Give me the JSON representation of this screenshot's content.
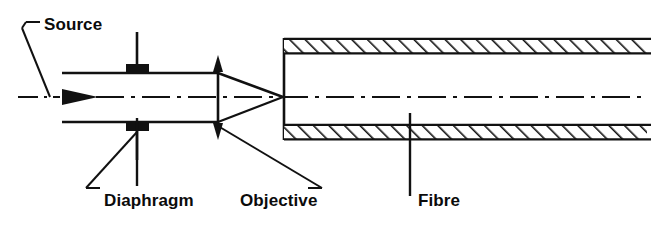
{
  "figure": {
    "type": "optical-ray-diagram",
    "background_color": "#ffffff",
    "line_color": "#111111"
  },
  "labels": {
    "source": "Source",
    "diaphragm": "Diaphragm",
    "objective": "Objective",
    "fibre": "Fibre"
  },
  "components": {
    "optical_axis": {
      "name": "optical-axis",
      "style": "dash-dot",
      "y": 97,
      "x_start": 18,
      "x_end": 641
    },
    "beam": {
      "name": "collimated-beam",
      "top_edge_y": 73,
      "bottom_edge_y": 122,
      "x_start": 62,
      "x_end": 218
    },
    "propagation_arrow": {
      "name": "beam-direction-arrow",
      "x": 78,
      "y": 97,
      "direction": "right"
    },
    "diaphragm": {
      "name": "diaphragm-aperture",
      "x": 137,
      "stop_top_y": 73,
      "stop_bottom_y": 122,
      "stem_top_y": 32,
      "stem_bottom_y": 160
    },
    "objective": {
      "name": "objective-lens",
      "x": 218,
      "symbol": "double-headed-arrow",
      "top_y": 55,
      "bottom_y": 140
    },
    "converging_cone": {
      "name": "converging-cone",
      "apex_x": 283,
      "apex_y": 97,
      "base_x": 218,
      "base_top_y": 73,
      "base_bottom_y": 122
    },
    "fibre": {
      "name": "fibre-cladding",
      "endface_x": 283,
      "x_end": 647,
      "top_bar": {
        "y_top": 38,
        "y_bottom": 54
      },
      "bottom_bar": {
        "y_top": 124,
        "y_bottom": 140
      },
      "hatch": "diagonal-45-up-right"
    }
  },
  "leaders": [
    {
      "name": "leader-source",
      "label": "Source",
      "elbow": "left",
      "from_x": 127,
      "from_y": 97
    },
    {
      "name": "leader-diaphragm",
      "label": "Diaphragm",
      "elbow": "left",
      "from_x": 137,
      "from_y": 160
    },
    {
      "name": "leader-objective",
      "label": "Objective",
      "elbow": "right",
      "from_x": 218,
      "from_y": 126
    },
    {
      "name": "leader-fibre",
      "label": "Fibre",
      "elbow": "none",
      "from_x": 410,
      "from_y": 124
    }
  ],
  "label_positions": {
    "source": {
      "x": 44,
      "y": 16
    },
    "diaphragm": {
      "x": 104,
      "y": 192
    },
    "objective": {
      "x": 240,
      "y": 192
    },
    "fibre": {
      "x": 418,
      "y": 192
    }
  }
}
